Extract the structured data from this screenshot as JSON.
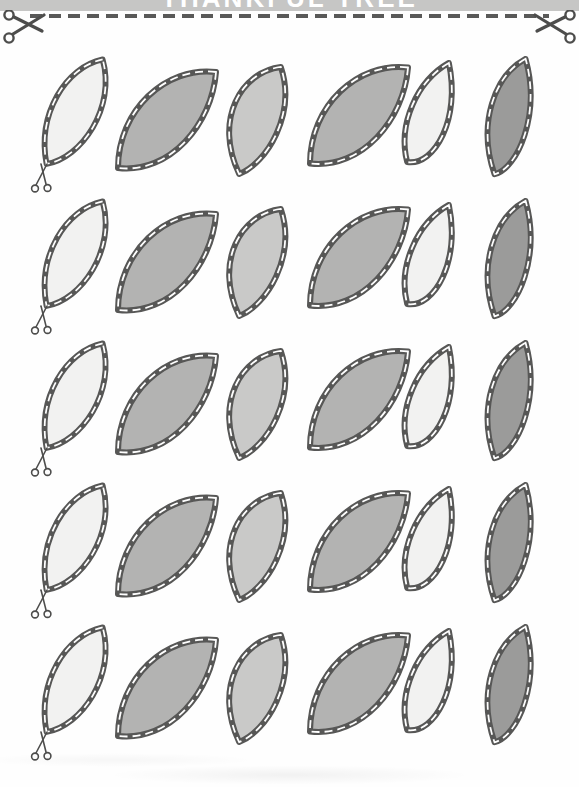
{
  "banner": {
    "title": "THANKFUL TREE",
    "background": "#c6c6c5",
    "text_color": "#ffffff",
    "note": "title mostly cropped at top edge of scan"
  },
  "cut_line": {
    "style": "dashed",
    "color": "#595958"
  },
  "icons": {
    "top_left": "scissors-icon",
    "top_right": "scissors-icon",
    "row_marker": "mini-scissors-icon"
  },
  "colors": {
    "outline": "#575756",
    "stitch": "#ffffff",
    "white_leaf": "#f2f2f1",
    "light_leaf": "#c9c9c8",
    "medium_leaf": "#b3b3b2",
    "dark_leaf": "#9b9b9a",
    "scissors": "#4d4d4c"
  },
  "grid": {
    "rows": 5,
    "columns": 6,
    "leaf_fill_pattern": [
      "white_leaf",
      "medium_leaf",
      "light_leaf",
      "medium_leaf",
      "white_leaf",
      "dark_leaf"
    ],
    "leaf_shape_pattern": [
      "broad",
      "tilted",
      "upright",
      "tilted",
      "narrow",
      "slim"
    ],
    "mini_scissors_on_first_leaf": true,
    "stitch_style": "white dashed running stitch inside dark applique border"
  }
}
